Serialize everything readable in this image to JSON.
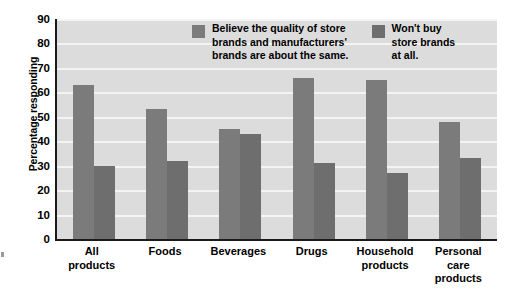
{
  "chart_data": {
    "type": "bar",
    "title": "",
    "xlabel": "",
    "ylabel": "Percentage responding",
    "ylim": [
      0,
      90
    ],
    "ytick_step": 10,
    "grid": true,
    "legend_position": "top-right-inside",
    "categories": [
      "All\nproducts",
      "Foods",
      "Beverages",
      "Drugs",
      "Household\nproducts",
      "Personal\ncare\nproducts"
    ],
    "yticks": [
      "90",
      "80",
      "70",
      "60",
      "50",
      "40",
      "30",
      "20",
      "10",
      "0"
    ],
    "series": [
      {
        "name": "Believe the quality of store\nbrands and manufacturers'\nbrands are about the same.",
        "color": "#7b7b7b",
        "values": [
          63,
          53,
          45,
          66,
          65,
          48
        ]
      },
      {
        "name": "Won't buy\nstore brands\nat all.",
        "color": "#6e6e6e",
        "values": [
          30,
          32,
          43,
          31,
          27,
          33
        ]
      }
    ],
    "plot_background": "#dcdcdc",
    "gridline_color": "#f4f4f4",
    "axis_color": "#1a1a1a"
  }
}
